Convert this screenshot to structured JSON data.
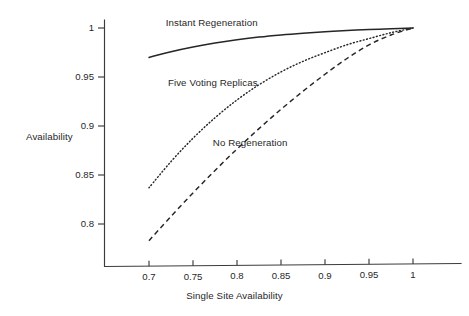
{
  "chart_data": {
    "type": "line",
    "title": "",
    "xlabel": "Single Site Availability",
    "ylabel": "Availability",
    "xlim": [
      0.68,
      1.03
    ],
    "ylim": [
      0.768,
      1.008
    ],
    "xticks": [
      "0.7",
      "0.75",
      "0.8",
      "0.85",
      "0.9",
      "0.95",
      "1"
    ],
    "xtick_values": [
      0.7,
      0.75,
      0.8,
      0.85,
      0.9,
      0.95,
      1.0
    ],
    "yticks": [
      "0.8",
      "0.85",
      "0.9",
      "0.95",
      "1"
    ],
    "ytick_values": [
      0.8,
      0.85,
      0.9,
      0.95,
      1.0
    ],
    "grid": false,
    "legend_position": "inline-annotations",
    "x": [
      0.7,
      0.725,
      0.75,
      0.775,
      0.8,
      0.825,
      0.85,
      0.875,
      0.9,
      0.925,
      0.95,
      0.975,
      1.0
    ],
    "series": [
      {
        "name": "Instant Regeneration",
        "style": "solid",
        "values": [
          0.97,
          0.9758,
          0.9806,
          0.9846,
          0.9879,
          0.9907,
          0.9929,
          0.9947,
          0.9962,
          0.9974,
          0.9984,
          0.9992,
          1.0
        ]
      },
      {
        "name": "Five Voting Replicas",
        "style": "dotted",
        "values": [
          0.837,
          0.8637,
          0.8875,
          0.9084,
          0.9266,
          0.9421,
          0.9552,
          0.966,
          0.9748,
          0.9829,
          0.9892,
          0.9952,
          1.0
        ]
      },
      {
        "name": "No Regeneration",
        "style": "dashed",
        "values": [
          0.783,
          0.8078,
          0.8317,
          0.8546,
          0.8765,
          0.8973,
          0.917,
          0.9355,
          0.9528,
          0.9689,
          0.9828,
          0.9929,
          1.0
        ]
      }
    ],
    "annotations": [
      {
        "text": "Instant Regeneration",
        "x": 0.719,
        "y": 1.0055
      },
      {
        "text": "Five Voting Replicas",
        "x": 0.7215,
        "y": 0.9445
      },
      {
        "text": "No Regeneration",
        "x": 0.7725,
        "y": 0.8835
      }
    ]
  },
  "axes": {
    "y_label": "Availability",
    "x_label": "Single Site Availability"
  },
  "colors": {
    "background": "#ffffff",
    "axis": "#3b3b3b",
    "curve": "#262626",
    "text": "#1f1f1f"
  }
}
